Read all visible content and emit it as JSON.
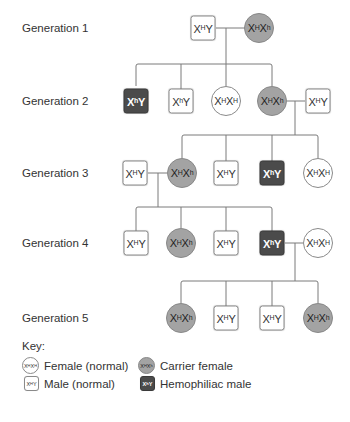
{
  "colors": {
    "line": "#7a7a7a",
    "normal_fill": "#ffffff",
    "carrier_fill": "#a3a3a3",
    "hemophiliac_fill": "#4b4b4b",
    "text": "#333333"
  },
  "generations": [
    {
      "label": "Generation 1"
    },
    {
      "label": "Generation 2"
    },
    {
      "label": "Generation 3"
    },
    {
      "label": "Generation 4"
    },
    {
      "label": "Generation 5"
    }
  ],
  "individuals": {
    "g1": [
      {
        "sex": "male",
        "status": "normal",
        "x1": "X",
        "s1": "H",
        "x2": "Y",
        "s2": ""
      },
      {
        "sex": "female",
        "status": "carrier",
        "x1": "X",
        "s1": "H",
        "x2": "X",
        "s2": "h"
      }
    ],
    "g2": [
      {
        "sex": "male",
        "status": "hemophiliac",
        "x1": "X",
        "s1": "h",
        "x2": "Y",
        "s2": ""
      },
      {
        "sex": "male",
        "status": "normal",
        "x1": "X",
        "s1": "h",
        "x2": "Y",
        "s2": ""
      },
      {
        "sex": "female",
        "status": "normal",
        "x1": "X",
        "s1": "H",
        "x2": "X",
        "s2": "H"
      },
      {
        "sex": "female",
        "status": "carrier",
        "x1": "X",
        "s1": "H",
        "x2": "X",
        "s2": "h"
      },
      {
        "sex": "male",
        "status": "normal",
        "x1": "X",
        "s1": "H",
        "x2": "Y",
        "s2": ""
      }
    ],
    "g3": [
      {
        "sex": "male",
        "status": "normal",
        "x1": "X",
        "s1": "H",
        "x2": "Y",
        "s2": ""
      },
      {
        "sex": "female",
        "status": "carrier",
        "x1": "X",
        "s1": "H",
        "x2": "X",
        "s2": "h"
      },
      {
        "sex": "male",
        "status": "normal",
        "x1": "X",
        "s1": "H",
        "x2": "Y",
        "s2": ""
      },
      {
        "sex": "male",
        "status": "hemophiliac",
        "x1": "X",
        "s1": "h",
        "x2": "Y",
        "s2": ""
      },
      {
        "sex": "female",
        "status": "normal",
        "x1": "X",
        "s1": "H",
        "x2": "X",
        "s2": "H"
      }
    ],
    "g4": [
      {
        "sex": "male",
        "status": "normal",
        "x1": "X",
        "s1": "H",
        "x2": "Y",
        "s2": ""
      },
      {
        "sex": "female",
        "status": "carrier",
        "x1": "X",
        "s1": "H",
        "x2": "X",
        "s2": "h"
      },
      {
        "sex": "male",
        "status": "normal",
        "x1": "X",
        "s1": "H",
        "x2": "Y",
        "s2": ""
      },
      {
        "sex": "male",
        "status": "hemophiliac",
        "x1": "X",
        "s1": "h",
        "x2": "Y",
        "s2": ""
      },
      {
        "sex": "female",
        "status": "normal",
        "x1": "X",
        "s1": "H",
        "x2": "X",
        "s2": "H"
      }
    ],
    "g5": [
      {
        "sex": "female",
        "status": "carrier",
        "x1": "X",
        "s1": "H",
        "x2": "X",
        "s2": "h"
      },
      {
        "sex": "male",
        "status": "normal",
        "x1": "X",
        "s1": "H",
        "x2": "Y",
        "s2": ""
      },
      {
        "sex": "male",
        "status": "normal",
        "x1": "X",
        "s1": "H",
        "x2": "Y",
        "s2": ""
      },
      {
        "sex": "female",
        "status": "carrier",
        "x1": "X",
        "s1": "H",
        "x2": "X",
        "s2": "h"
      }
    ]
  },
  "key": {
    "title": "Key:",
    "items": [
      {
        "label": "Female (normal)",
        "x1": "X",
        "s1": "H",
        "x2": "X",
        "s2": "H"
      },
      {
        "label": "Carrier female",
        "x1": "X",
        "s1": "H",
        "x2": "X",
        "s2": "h"
      },
      {
        "label": "Male (normal)",
        "x1": "X",
        "s1": "H",
        "x2": "Y",
        "s2": ""
      },
      {
        "label": "Hemophiliac male",
        "x1": "X",
        "s1": "h",
        "x2": "Y",
        "s2": ""
      }
    ]
  }
}
